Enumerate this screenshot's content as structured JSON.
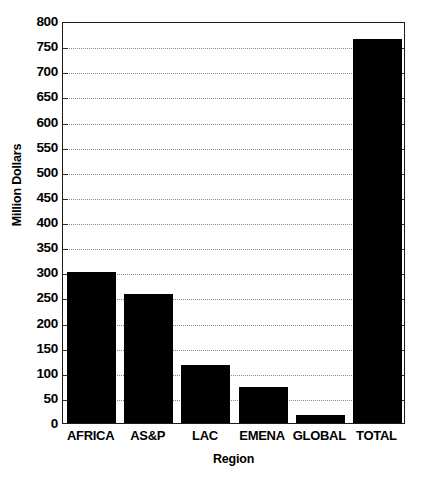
{
  "chart_data": {
    "type": "bar",
    "title": "",
    "xlabel": "Region",
    "ylabel": "Million Dollars",
    "categories": [
      "AFRICA",
      "AS&P",
      "LAC",
      "EMENA",
      "GLOBAL",
      "TOTAL"
    ],
    "values": [
      301,
      256,
      115,
      71,
      16,
      765
    ],
    "ylim": [
      0,
      800
    ],
    "ytick_step": 50,
    "yticks": [
      0,
      50,
      100,
      150,
      200,
      250,
      300,
      350,
      400,
      450,
      500,
      550,
      600,
      650,
      700,
      750,
      800
    ],
    "ytick_labels": [
      "0",
      "50",
      "100",
      "150",
      "200",
      "250",
      "300",
      "350",
      "400",
      "450",
      "500",
      "550",
      "600",
      "650",
      "700",
      "750",
      "800"
    ],
    "grid": true,
    "grid_axis": "y",
    "grid_style": "dotted",
    "legend": false,
    "legend_position": "none",
    "bar_color": "#000000",
    "grid_color": "#8a8a8a",
    "axis_color": "#1a1a1a",
    "background_color": "#ffffff",
    "series": [
      {
        "name": "Million Dollars",
        "values": [
          301,
          256,
          115,
          71,
          16,
          765
        ]
      }
    ]
  }
}
